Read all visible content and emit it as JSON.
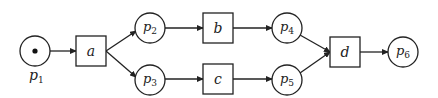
{
  "diagram": {
    "type": "petri-net",
    "places": [
      {
        "id": "p1",
        "label": "p",
        "sub": "1",
        "cx": 35,
        "cy": 51,
        "tokens": 1,
        "label_position": "below"
      },
      {
        "id": "p2",
        "label": "p",
        "sub": "2",
        "cx": 150,
        "cy": 28,
        "tokens": 0,
        "label_position": "inside"
      },
      {
        "id": "p3",
        "label": "p",
        "sub": "3",
        "cx": 150,
        "cy": 80,
        "tokens": 0,
        "label_position": "inside"
      },
      {
        "id": "p4",
        "label": "p",
        "sub": "4",
        "cx": 287,
        "cy": 28,
        "tokens": 0,
        "label_position": "inside"
      },
      {
        "id": "p5",
        "label": "p",
        "sub": "5",
        "cx": 287,
        "cy": 80,
        "tokens": 0,
        "label_position": "inside"
      },
      {
        "id": "p6",
        "label": "p",
        "sub": "6",
        "cx": 403,
        "cy": 52,
        "tokens": 0,
        "label_position": "inside"
      }
    ],
    "transitions": [
      {
        "id": "a",
        "label": "a",
        "x": 76,
        "y": 36,
        "w": 30,
        "h": 30
      },
      {
        "id": "b",
        "label": "b",
        "x": 203,
        "y": 13,
        "w": 30,
        "h": 30
      },
      {
        "id": "c",
        "label": "c",
        "x": 203,
        "y": 64,
        "w": 30,
        "h": 30
      },
      {
        "id": "d",
        "label": "d",
        "x": 330,
        "y": 37,
        "w": 30,
        "h": 30
      }
    ],
    "arcs": [
      {
        "from": "p1",
        "to": "a"
      },
      {
        "from": "a",
        "to": "p2"
      },
      {
        "from": "a",
        "to": "p3"
      },
      {
        "from": "p2",
        "to": "b"
      },
      {
        "from": "p3",
        "to": "c"
      },
      {
        "from": "b",
        "to": "p4"
      },
      {
        "from": "c",
        "to": "p5"
      },
      {
        "from": "p4",
        "to": "d"
      },
      {
        "from": "p5",
        "to": "d"
      },
      {
        "from": "d",
        "to": "p6"
      }
    ],
    "colors": {
      "stroke": "#222222",
      "fill": "#ffffff",
      "token": "#111111"
    }
  }
}
